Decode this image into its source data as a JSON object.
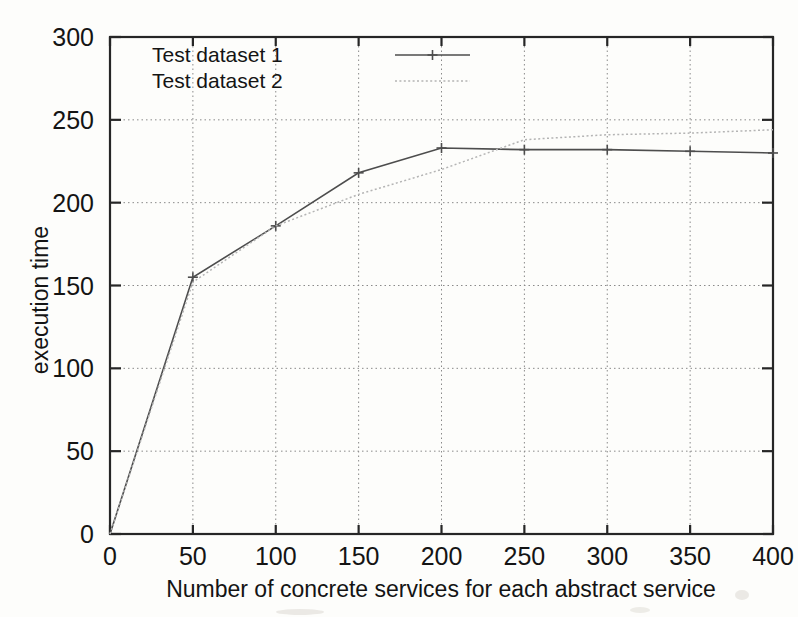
{
  "chart_data": {
    "type": "line",
    "title": "",
    "xlabel": "Number of concrete services for each abstract service",
    "ylabel": "execution time",
    "xlim": [
      0,
      400
    ],
    "ylim": [
      0,
      300
    ],
    "xticks": [
      0,
      50,
      100,
      150,
      200,
      250,
      300,
      350,
      400
    ],
    "yticks": [
      0,
      50,
      100,
      150,
      200,
      250,
      300
    ],
    "xtick_labels": [
      "0",
      "50",
      "100",
      "150",
      "200",
      "250",
      "300",
      "350",
      "400"
    ],
    "ytick_labels": [
      "0",
      "50",
      "100",
      "150",
      "200",
      "250",
      "300"
    ],
    "grid": true,
    "legend_position": "top-left-inside",
    "x": [
      0,
      50,
      100,
      150,
      200,
      250,
      300,
      350,
      400
    ],
    "series": [
      {
        "name": "Test dataset 1",
        "style": "solid",
        "marker": "plus",
        "color": "#4d4d4d",
        "values": [
          0,
          155,
          186,
          218,
          233,
          232,
          232,
          231,
          230
        ]
      },
      {
        "name": "Test dataset 2",
        "style": "dotted",
        "marker": "none",
        "color": "#b4b4b4",
        "values": [
          0,
          152,
          186,
          205,
          220,
          238,
          241,
          242,
          244
        ]
      }
    ],
    "legend": [
      {
        "label": "Test dataset 1",
        "style": "solid",
        "marker": "plus",
        "color": "#4d4d4d"
      },
      {
        "label": "Test dataset 2",
        "style": "dotted",
        "marker": "none",
        "color": "#b4b4b4"
      }
    ],
    "colors": {
      "background": "#fdfdfb",
      "axis": "#262626",
      "grid": "#8a8a8a",
      "series_1": "#4d4d4d",
      "series_2": "#b4b4b4",
      "text": "#141414"
    }
  }
}
